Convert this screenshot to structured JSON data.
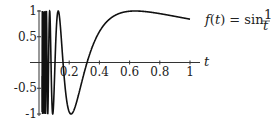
{
  "chart_data": {
    "type": "line",
    "title": "",
    "function": "f(t) = sin(1/t)",
    "series": [
      {
        "name": "f(t) = sin 1/t",
        "x_range": [
          0.02,
          1.0
        ]
      }
    ],
    "xlabel": "t",
    "ylabel": "",
    "xlim": [
      0,
      1.08
    ],
    "ylim": [
      -1,
      1
    ],
    "x_ticks": [
      "0.2",
      "0.4",
      "0.6",
      "0.8",
      "1"
    ],
    "y_ticks": [
      "1",
      "0.5",
      "-0.5",
      "-1"
    ],
    "annotation": {
      "prefix": "f(t) = sin ",
      "num": "1",
      "den": "t"
    },
    "grid": false
  }
}
